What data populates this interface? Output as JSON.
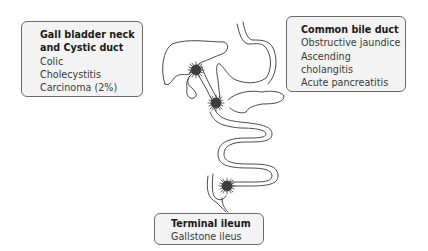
{
  "boxes": {
    "gallbladder": {
      "title_line1": "Gall bladder neck",
      "title_line2": "and Cystic duct",
      "items": [
        "Colic",
        "Cholecystitis",
        "Carcinoma (2%)"
      ]
    },
    "common_bile_duct": {
      "title": "Common bile duct",
      "items": [
        "Obstructive jaundice",
        "Ascending cholangitis",
        "Acute pancreatitis"
      ]
    },
    "terminal_ileum": {
      "title": "Terminal ileum",
      "items": [
        "Gallstone ileus"
      ]
    }
  },
  "colors": {
    "box_fill": "#f3f3f3",
    "box_border": "#6b6b6b",
    "outline": "#4a4a4a",
    "stone": "#3c3c3c"
  },
  "markers": [
    {
      "name": "stone-gallbladder-neck",
      "x": 196,
      "y": 70
    },
    {
      "name": "stone-common-bile-duct",
      "x": 216,
      "y": 103
    },
    {
      "name": "stone-terminal-ileum",
      "x": 227,
      "y": 186
    }
  ]
}
